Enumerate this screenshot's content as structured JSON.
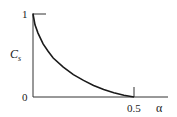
{
  "chart_data": {
    "type": "line",
    "title": "",
    "xlabel": "α",
    "ylabel": "C_s",
    "ylabel_main": "C",
    "ylabel_sub": "s",
    "xlim": [
      0,
      0.55
    ],
    "ylim": [
      0,
      1.05
    ],
    "x_ticks": [
      {
        "value": 0.5,
        "label": "0.5"
      }
    ],
    "y_ticks": [
      {
        "value": 0,
        "label": "0"
      },
      {
        "value": 1,
        "label": "1"
      }
    ],
    "grid": false,
    "legend": null,
    "series": [
      {
        "name": "C_s vs α",
        "x": [
          0.0,
          0.01,
          0.025,
          0.05,
          0.075,
          0.1,
          0.15,
          0.2,
          0.25,
          0.3,
          0.35,
          0.4,
          0.45,
          0.5
        ],
        "values": [
          1.0,
          0.87,
          0.77,
          0.64,
          0.55,
          0.47,
          0.36,
          0.27,
          0.2,
          0.14,
          0.09,
          0.05,
          0.02,
          0.0
        ]
      }
    ]
  },
  "colors": {
    "line": "#1a1a1a",
    "axis": "#333333",
    "background": "#ffffff"
  }
}
